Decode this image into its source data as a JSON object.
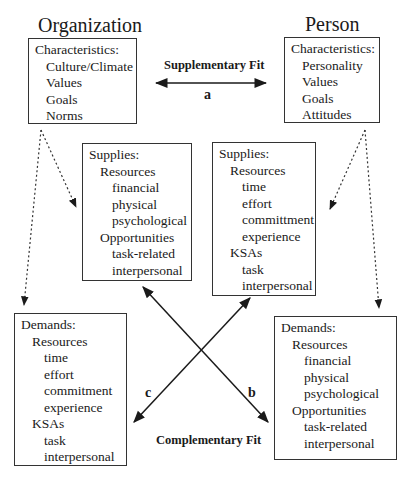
{
  "organization": {
    "title": "Organization",
    "characteristics": {
      "heading": "Characteristics:",
      "items": [
        "Culture/Climate",
        "Values",
        "Goals",
        "Norms"
      ]
    },
    "supplies": {
      "heading": "Supplies:",
      "groups": [
        {
          "label": "Resources",
          "items": [
            "financial",
            "physical",
            "psychological"
          ]
        },
        {
          "label": "Opportunities",
          "items": [
            "task-related",
            "interpersonal"
          ]
        }
      ]
    },
    "demands": {
      "heading": "Demands:",
      "groups": [
        {
          "label": "Resources",
          "items": [
            "time",
            "effort",
            "commitment",
            "experience"
          ]
        },
        {
          "label": "KSAs",
          "items": [
            "task",
            "interpersonal"
          ]
        }
      ]
    }
  },
  "person": {
    "title": "Person",
    "characteristics": {
      "heading": "Characteristics:",
      "items": [
        "Personality",
        "Values",
        "Goals",
        "Attitudes"
      ]
    },
    "supplies": {
      "heading": "Supplies:",
      "groups": [
        {
          "label": "Resources",
          "items": [
            "time",
            "effort",
            "committment",
            "experience"
          ]
        },
        {
          "label": "KSAs",
          "items": [
            "task",
            "interpersonal"
          ]
        }
      ]
    },
    "demands": {
      "heading": "Demands:",
      "groups": [
        {
          "label": "Resources",
          "items": [
            "financial",
            "physical",
            "psychological"
          ]
        },
        {
          "label": "Opportunities",
          "items": [
            "task-related",
            "interpersonal"
          ]
        }
      ]
    }
  },
  "links": {
    "supplementary_fit": {
      "label": "Supplementary Fit",
      "letter": "a"
    },
    "complementary_fit": {
      "label": "Complementary Fit"
    },
    "arrow_b": {
      "letter": "b"
    },
    "arrow_c": {
      "letter": "c"
    }
  },
  "colors": {
    "line": "#1a1a1a",
    "box_border": "#333333",
    "background": "#ffffff"
  }
}
